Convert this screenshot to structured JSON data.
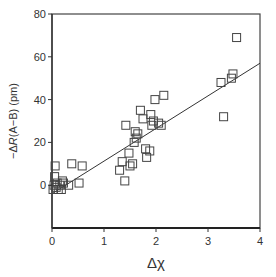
{
  "chart_data": {
    "type": "scatter",
    "title": "",
    "xlabel": "Δχ",
    "ylabel": "−ΔR(A−B) (pm)",
    "xlim": [
      0,
      4
    ],
    "ylim": [
      -20,
      80
    ],
    "xticks": [
      0,
      1,
      2,
      3,
      4
    ],
    "yticks": [
      0,
      20,
      40,
      60,
      80
    ],
    "grid": false,
    "legend": null,
    "marker": "open-square",
    "series": [
      {
        "name": "data",
        "points": [
          [
            0.02,
            -2
          ],
          [
            0.04,
            0
          ],
          [
            0.05,
            4
          ],
          [
            0.06,
            9
          ],
          [
            0.08,
            -1
          ],
          [
            0.1,
            1
          ],
          [
            0.12,
            -2
          ],
          [
            0.15,
            0
          ],
          [
            0.18,
            -2
          ],
          [
            0.2,
            2
          ],
          [
            0.22,
            1
          ],
          [
            0.32,
            0
          ],
          [
            0.38,
            10
          ],
          [
            0.52,
            1
          ],
          [
            0.58,
            9
          ],
          [
            1.3,
            7
          ],
          [
            1.35,
            11
          ],
          [
            1.4,
            2
          ],
          [
            1.42,
            28
          ],
          [
            1.48,
            15
          ],
          [
            1.5,
            9
          ],
          [
            1.55,
            10
          ],
          [
            1.58,
            20
          ],
          [
            1.6,
            25
          ],
          [
            1.62,
            22
          ],
          [
            1.65,
            24
          ],
          [
            1.7,
            35
          ],
          [
            1.75,
            31
          ],
          [
            1.8,
            17
          ],
          [
            1.82,
            13
          ],
          [
            1.88,
            16
          ],
          [
            1.9,
            33
          ],
          [
            1.92,
            28
          ],
          [
            1.95,
            30
          ],
          [
            1.98,
            40
          ],
          [
            2.05,
            29
          ],
          [
            2.1,
            28
          ],
          [
            2.15,
            42
          ],
          [
            3.25,
            48
          ],
          [
            3.3,
            32
          ],
          [
            3.45,
            50
          ],
          [
            3.48,
            52
          ],
          [
            3.55,
            69
          ]
        ]
      }
    ],
    "fit_line": {
      "x": [
        0,
        4
      ],
      "y": [
        -4,
        57
      ]
    }
  },
  "axes": {
    "xlabel": "Δχ",
    "ylabel_prefix": "−Δ",
    "ylabel_italic": "R",
    "ylabel_suffix": "(A−B) (pm)",
    "xtick_labels": [
      "0",
      "1",
      "2",
      "3",
      "4"
    ],
    "ytick_labels": [
      "0",
      "20",
      "40",
      "60",
      "80"
    ]
  }
}
